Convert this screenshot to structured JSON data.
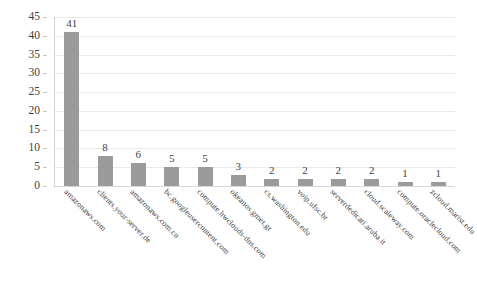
{
  "chart_data": {
    "type": "bar",
    "title": "",
    "subtitle": "",
    "xlabel": "",
    "ylabel": "",
    "ylim": [
      0,
      45
    ],
    "ytick_step": 5,
    "yticks": [
      "0",
      "5",
      "10",
      "15",
      "20",
      "25",
      "30",
      "35",
      "40",
      "45"
    ],
    "grid": true,
    "legend": false,
    "legend_position": "none",
    "orientation": "vertical",
    "bar_color": "#9b9b9b",
    "gridline_color": "#e9e9e9",
    "value_labels_shown": true,
    "xtick_rotation": 45,
    "categories": [
      "amazonaws.com",
      "clients.your-server.de",
      "amazonaws.com.cn",
      "bc.googleusercontent.com",
      "compute.hwclouds-dns.com",
      "okeanos.gmet.gr",
      "cs.washington.edu",
      "voip.ufsc.br",
      "serverdedicati.aruba.it",
      "cloud.scaleway.com",
      "compute.oraclecloud.com",
      "zcloud.marist.edu"
    ],
    "values": [
      41,
      8,
      6,
      5,
      5,
      3,
      2,
      2,
      2,
      2,
      1,
      1
    ],
    "value_labels": [
      "41",
      "8",
      "6",
      "5",
      "5",
      "3",
      "2",
      "2",
      "2",
      "2",
      "1",
      "1"
    ]
  }
}
